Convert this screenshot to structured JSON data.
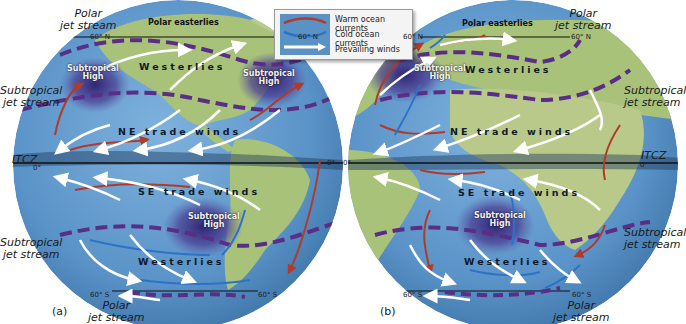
{
  "legend": {
    "items": [
      {
        "label": "Warm ocean currents",
        "color": "#b23a2a"
      },
      {
        "label": "Cold ocean currents",
        "color": "#2c73c8"
      },
      {
        "label": "Prevailing winds",
        "color": "#ffffff"
      }
    ]
  },
  "colors": {
    "ocean": "#5d97cc",
    "land": "#a9c27a",
    "jet_stream_dash": "#5a2d86",
    "high_pressure": "#3c2a7a",
    "itcz_band": "#1f3a5a"
  },
  "panel_a": {
    "panel_label": "(a)",
    "side_labels": {
      "polar_jet_north": "Polar\njet stream",
      "subtropical_jet_north": "Subtropical\njet stream",
      "itcz": "ITCZ",
      "subtropical_jet_south": "Subtropical\njet stream",
      "polar_jet_south": "Polar\njet stream"
    },
    "latitudes": {
      "n60_left": "60° N",
      "n60_right": "60° N",
      "eq_right": "0°",
      "eq_left": "0°",
      "s60_left": "60° S",
      "s60_right": "60° S"
    },
    "map_labels": {
      "polar_easterlies": "Polar easterlies",
      "westerlies_north": "Westerlies",
      "subtropical_high_nw": "Subtropical\nHigh",
      "subtropical_high_ne": "Subtropical\nHigh",
      "ne_trade_winds": "NE trade winds",
      "se_trade_winds": "SE trade winds",
      "subtropical_high_south": "Subtropical\nHigh",
      "westerlies_south": "Westerlies"
    }
  },
  "panel_b": {
    "panel_label": "(b)",
    "side_labels": {
      "polar_jet_north": "Polar\njet stream",
      "subtropical_jet_north": "Subtropical\njet stream",
      "itcz": "ITCZ",
      "subtropical_jet_south": "Subtropical\njet stream",
      "polar_jet_south": "Polar\njet stream"
    },
    "latitudes": {
      "n60_left": "60° N",
      "n60_right": "60° N",
      "eq_left": "0°",
      "eq_right": "0°",
      "s60_left": "60° S",
      "s60_right": "60° S"
    },
    "map_labels": {
      "polar_easterlies": "Polar easterlies",
      "subtropical_high_north": "Subtropical\nHigh",
      "westerlies_north": "Westerlies",
      "ne_trade_winds": "NE trade winds",
      "se_trade_winds": "SE trade winds",
      "subtropical_high_south": "Subtropical\nHigh",
      "westerlies_south": "Westerlies"
    }
  }
}
